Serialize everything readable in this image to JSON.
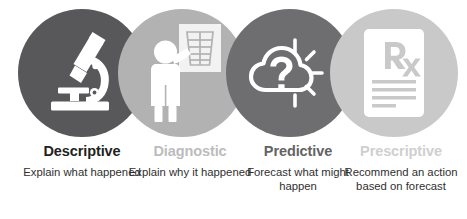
{
  "background_color": "#ffffff",
  "stages": [
    {
      "id": "descriptive",
      "title": "Descriptive",
      "description": "Explain what happened",
      "icon": "microscope-icon",
      "circle_color": "#58585a",
      "title_color": "#231f20",
      "icon_color": "#ffffff"
    },
    {
      "id": "diagnostic",
      "title": "Diagnostic",
      "description": "Explain why it happened",
      "icon": "xray-doctor-icon",
      "circle_color": "#b2b2b2",
      "title_color": "#bcbcbc",
      "icon_color": "#ffffff"
    },
    {
      "id": "predictive",
      "title": "Predictive",
      "description": "Forecast what might happen",
      "icon": "cloud-sun-question-icon",
      "circle_color": "#6e6e70",
      "title_color": "#636363",
      "icon_color": "#ffffff"
    },
    {
      "id": "prescriptive",
      "title": "Prescriptive",
      "description": "Recommend an action based on forecast",
      "icon": "rx-prescription-icon",
      "circle_color": "#c9c9c9",
      "title_color": "#cfcfcf",
      "icon_color": "#ffffff"
    }
  ]
}
